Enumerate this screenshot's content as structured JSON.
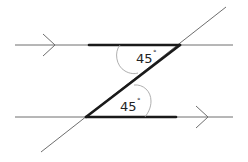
{
  "diagram": {
    "angles": [
      {
        "id": "top",
        "value": "45",
        "unit": "°"
      },
      {
        "id": "bottom",
        "value": "45",
        "unit": "°"
      }
    ],
    "colors": {
      "thin_line": "#6e6e6e",
      "thick_line": "#1a1a1a",
      "arc": "#9a9a9a",
      "text": "#222222",
      "background": "#ffffff"
    }
  }
}
